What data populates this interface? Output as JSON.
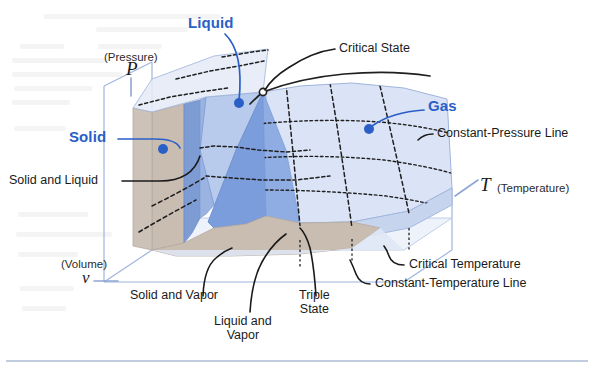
{
  "figure": {
    "kind": "p-v-T surface diagram",
    "colors": {
      "label_blue": "#2a5fc8",
      "text_black": "#1a1a1a",
      "solid_region": "#c9bdb2",
      "solid_liquid_strip": "#7e9cd4",
      "liquid_region": "#b8cbec",
      "liquid_vapor_dome": "#7c9ddb",
      "gas_surface": "#dbe4f6",
      "box_edge": "#9fb4dd",
      "baseline_rule": "#aebdd6"
    }
  },
  "axes": {
    "pressure": {
      "symbol": "P",
      "name": "(Pressure)"
    },
    "volume": {
      "symbol": "v",
      "name": "(Volume)"
    },
    "temperature": {
      "symbol": "T",
      "name": "(Temperature)"
    }
  },
  "region_labels": [
    {
      "id": "solid",
      "text": "Solid"
    },
    {
      "id": "liquid",
      "text": "Liquid"
    },
    {
      "id": "gas",
      "text": "Gas"
    }
  ],
  "callouts": [
    {
      "id": "solid-and-liquid",
      "text": "Solid and Liquid"
    },
    {
      "id": "critical-state",
      "text": "Critical State"
    },
    {
      "id": "constant-pressure-line",
      "text": "Constant-Pressure Line"
    },
    {
      "id": "critical-temperature",
      "text": "Critical Temperature"
    },
    {
      "id": "constant-temperature-line",
      "text": "Constant-Temperature Line"
    },
    {
      "id": "solid-and-vapor",
      "text": "Solid and Vapor"
    },
    {
      "id": "triple-state",
      "text": "Triple\nState",
      "line1": "Triple",
      "line2": "State"
    },
    {
      "id": "liquid-and-vapor",
      "text": "Liquid and\nVapor",
      "line1": "Liquid and",
      "line2": "Vapor"
    }
  ]
}
